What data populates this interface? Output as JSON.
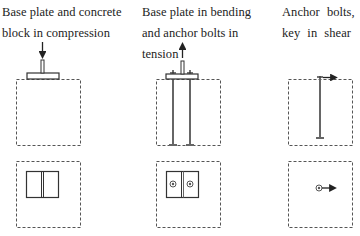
{
  "panels": [
    {
      "caption": "Base plate and concrete block in compression",
      "load": "compression",
      "arrow_direction": "down",
      "bolts_elevation": 0,
      "plan_rings": 0
    },
    {
      "caption": "Base plate in bending and anchor bolts in tension",
      "load": "tension",
      "arrow_direction": "up",
      "bolts_elevation": 2,
      "plan_rings": 2
    },
    {
      "caption": "Anchor bolts, key in shear",
      "load": "shear",
      "arrow_direction": "right",
      "bolts_elevation": 1,
      "plan_rings": 1
    }
  ],
  "colors": {
    "line": "#333333",
    "dashed": "#555555",
    "bolt": "#666666",
    "background": "#ffffff"
  }
}
